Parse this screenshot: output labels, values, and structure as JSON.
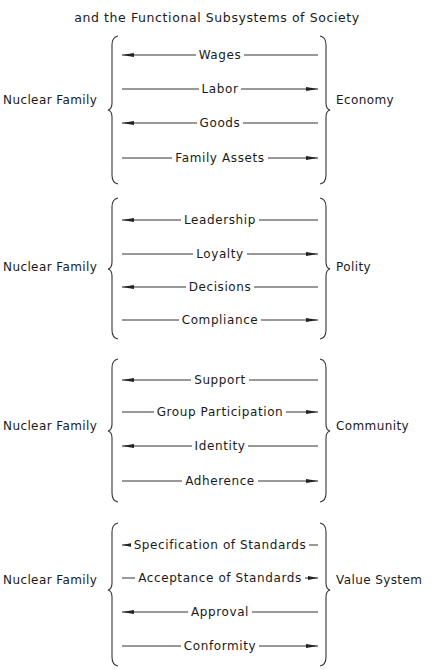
{
  "title": "and the Functional Subsystems of Society",
  "groups": [
    {
      "left": "Nuclear Family",
      "right": "Economy",
      "rows": [
        {
          "label": "Wages",
          "direction": "left"
        },
        {
          "label": "Labor",
          "direction": "right"
        },
        {
          "label": "Goods",
          "direction": "left"
        },
        {
          "label": "Family Assets",
          "direction": "right"
        }
      ]
    },
    {
      "left": "Nuclear Family",
      "right": "Polity",
      "rows": [
        {
          "label": "Leadership",
          "direction": "left"
        },
        {
          "label": "Loyalty",
          "direction": "right"
        },
        {
          "label": "Decisions",
          "direction": "left"
        },
        {
          "label": "Compliance",
          "direction": "right"
        }
      ]
    },
    {
      "left": "Nuclear Family",
      "right": "Community",
      "rows": [
        {
          "label": "Support",
          "direction": "left"
        },
        {
          "label": "Group Participation",
          "direction": "right"
        },
        {
          "label": "Identity",
          "direction": "left"
        },
        {
          "label": "Adherence",
          "direction": "right"
        }
      ]
    },
    {
      "left": "Nuclear Family",
      "right": "Value System",
      "rows": [
        {
          "label": "Specification of Standards",
          "direction": "left"
        },
        {
          "label": "Acceptance of Standards",
          "direction": "right"
        },
        {
          "label": "Approval",
          "direction": "left"
        },
        {
          "label": "Conformity",
          "direction": "right"
        }
      ]
    }
  ]
}
